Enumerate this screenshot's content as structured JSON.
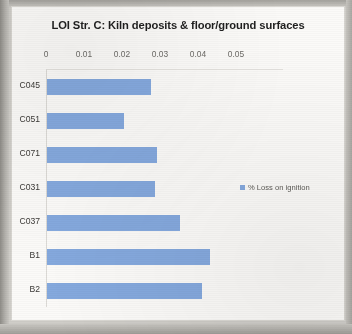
{
  "chart_data": {
    "type": "bar",
    "orientation": "horizontal",
    "title": "LOI Str. C: Kiln deposits & floor/ground surfaces",
    "xlabel": "",
    "ylabel": "",
    "categories": [
      "C045",
      "C051",
      "C071",
      "C031",
      "C037",
      "B1",
      "B2"
    ],
    "series": [
      {
        "name": "% Loss on ignition",
        "values": [
          0.0274,
          0.0203,
          0.029,
          0.0284,
          0.035,
          0.0429,
          0.0408
        ]
      }
    ],
    "xlim": [
      0,
      0.055
    ],
    "xticks": [
      0,
      0.01,
      0.02,
      0.03,
      0.04,
      0.05
    ],
    "xtick_labels": [
      "0",
      "0.01",
      "0.02",
      "0.03",
      "0.04",
      "0.05"
    ],
    "grid": false,
    "legend": {
      "position": "right",
      "entries": [
        {
          "label": "% Loss on ignition",
          "color": "#85a9de"
        }
      ]
    },
    "colors": {
      "bar": "#85a9de",
      "plot_background": "#fbfaf8",
      "axis_line": "#dcdad6",
      "title_text": "#1f1f1f",
      "tick_text": "#6d6b67",
      "category_text": "#3c3a37",
      "page_background": "#cfcdc8"
    }
  }
}
